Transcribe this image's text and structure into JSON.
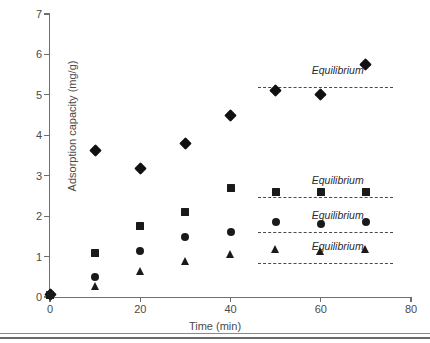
{
  "chart_data": {
    "type": "scatter",
    "title": "",
    "xlabel": "Time (min)",
    "ylabel": "Adsorption capacity (mg/g)",
    "xlim": [
      0,
      80
    ],
    "ylim": [
      0,
      7
    ],
    "xticks": [
      0,
      20,
      40,
      60,
      80
    ],
    "yticks": [
      0,
      1,
      2,
      3,
      4,
      5,
      6,
      7
    ],
    "grid": false,
    "legend": "none",
    "x": [
      0,
      10,
      20,
      30,
      40,
      50,
      60,
      70
    ],
    "series": [
      {
        "name": "diamond-series",
        "marker": "diamond",
        "color": "#111111",
        "values": [
          0.05,
          3.62,
          3.17,
          3.8,
          4.5,
          5.1,
          5.0,
          5.75
        ]
      },
      {
        "name": "square-series",
        "marker": "square",
        "color": "#1a1a1a",
        "values": [
          0.05,
          1.1,
          1.75,
          2.1,
          2.7,
          2.6,
          2.6,
          2.6
        ]
      },
      {
        "name": "circle-series",
        "marker": "circle",
        "color": "#1a1a1a",
        "values": [
          0.05,
          0.5,
          1.15,
          1.48,
          1.61,
          1.85,
          1.8,
          1.85
        ]
      },
      {
        "name": "triangle-series",
        "marker": "triangle",
        "color": "#1a1a1a",
        "values": [
          0.05,
          0.27,
          0.65,
          0.9,
          1.06,
          1.18,
          1.13,
          1.18
        ]
      }
    ],
    "annotations": [
      {
        "label": "Equilibrium",
        "y": 5.2,
        "x_start": 46.0,
        "x_end": 76.0,
        "label_x": 58.0,
        "label_dy": 0.42
      },
      {
        "label": "Equilibrium",
        "y": 2.47,
        "x_start": 46.0,
        "x_end": 76.0,
        "label_x": 58.0,
        "label_dy": 0.42
      },
      {
        "label": "Equilibrium",
        "y": 1.62,
        "x_start": 46.0,
        "x_end": 76.0,
        "label_x": 58.0,
        "label_dy": 0.42
      },
      {
        "label": "Equilibrium",
        "y": 0.84,
        "x_start": 46.0,
        "x_end": 76.0,
        "label_x": 58.0,
        "label_dy": 0.42
      }
    ]
  }
}
